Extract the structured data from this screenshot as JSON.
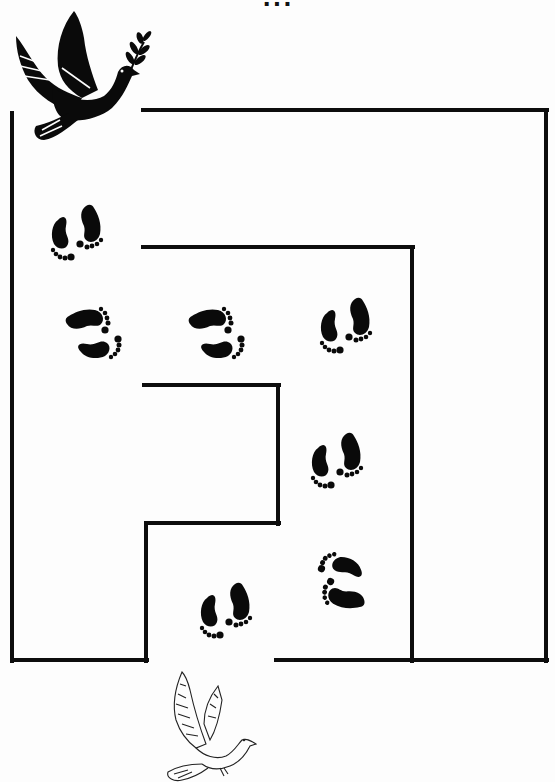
{
  "page": {
    "title_fragment": "...",
    "type": "maze worksheet"
  },
  "start": {
    "icon": "black-dove-with-olive-branch-icon",
    "position": "top-left"
  },
  "finish": {
    "icon": "white-outline-dove-icon",
    "position": "bottom-center"
  },
  "colors": {
    "wall": "#0d0d0d",
    "footprint": "#0a0a0a",
    "background": "#fdfdfd"
  },
  "maze": {
    "walls": [
      {
        "name": "outer-top",
        "x1": 143,
        "y1": 110,
        "x2": 547,
        "y2": 110
      },
      {
        "name": "outer-right",
        "x1": 546,
        "y1": 110,
        "x2": 546,
        "y2": 661
      },
      {
        "name": "outer-left",
        "x1": 12,
        "y1": 113,
        "x2": 12,
        "y2": 661
      },
      {
        "name": "bottom-left",
        "x1": 12,
        "y1": 660,
        "x2": 147,
        "y2": 660
      },
      {
        "name": "bottom-left-up",
        "x1": 146,
        "y1": 523,
        "x2": 146,
        "y2": 661
      },
      {
        "name": "bottom-right",
        "x1": 276,
        "y1": 660,
        "x2": 547,
        "y2": 660
      },
      {
        "name": "inner-top",
        "x1": 143,
        "y1": 247,
        "x2": 413,
        "y2": 247
      },
      {
        "name": "inner-right",
        "x1": 412,
        "y1": 247,
        "x2": 412,
        "y2": 661
      },
      {
        "name": "core-top",
        "x1": 144,
        "y1": 385,
        "x2": 279,
        "y2": 385
      },
      {
        "name": "core-right",
        "x1": 278,
        "y1": 385,
        "x2": 278,
        "y2": 524
      },
      {
        "name": "core-bottom",
        "x1": 146,
        "y1": 523,
        "x2": 279,
        "y2": 523
      }
    ],
    "footprints": [
      {
        "x": 80,
        "y": 232,
        "rotate": 0,
        "label": "step 1"
      },
      {
        "x": 95,
        "y": 328,
        "rotate": -90,
        "label": "step 2"
      },
      {
        "x": 218,
        "y": 328,
        "rotate": -90,
        "label": "step 3"
      },
      {
        "x": 349,
        "y": 325,
        "rotate": 0,
        "label": "step 4"
      },
      {
        "x": 340,
        "y": 460,
        "rotate": 0,
        "label": "step 5"
      },
      {
        "x": 340,
        "y": 583,
        "rotate": 110,
        "label": "step 6"
      },
      {
        "x": 229,
        "y": 610,
        "rotate": 0,
        "label": "step 7"
      }
    ]
  }
}
